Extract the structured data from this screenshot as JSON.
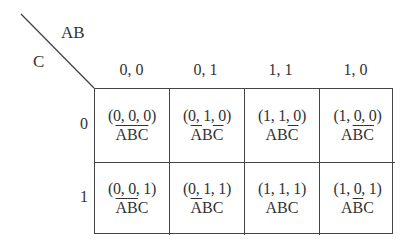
{
  "kmap": {
    "corner": {
      "col_var": "AB",
      "row_var": "C"
    },
    "col_headers": [
      "0, 0",
      "0, 1",
      "1, 1",
      "1, 0"
    ],
    "row_headers": [
      "0",
      "1"
    ],
    "rows": [
      [
        {
          "tuple": "(0, 0, 0)",
          "term": [
            {
              "v": "A",
              "neg": true
            },
            {
              "v": "B",
              "neg": true
            },
            {
              "v": "C",
              "neg": true
            }
          ]
        },
        {
          "tuple": "(0, 1, 0)",
          "term": [
            {
              "v": "A",
              "neg": true
            },
            {
              "v": "B",
              "neg": false
            },
            {
              "v": "C",
              "neg": true
            }
          ]
        },
        {
          "tuple": "(1, 1, 0)",
          "term": [
            {
              "v": "A",
              "neg": false
            },
            {
              "v": "B",
              "neg": false
            },
            {
              "v": "C",
              "neg": true
            }
          ]
        },
        {
          "tuple": "(1, 0, 0)",
          "term": [
            {
              "v": "A",
              "neg": false
            },
            {
              "v": "B",
              "neg": true
            },
            {
              "v": "C",
              "neg": true
            }
          ]
        }
      ],
      [
        {
          "tuple": "(0, 0, 1)",
          "term": [
            {
              "v": "A",
              "neg": true
            },
            {
              "v": "B",
              "neg": true
            },
            {
              "v": "C",
              "neg": false
            }
          ]
        },
        {
          "tuple": "(0, 1, 1)",
          "term": [
            {
              "v": "A",
              "neg": true
            },
            {
              "v": "B",
              "neg": false
            },
            {
              "v": "C",
              "neg": false
            }
          ]
        },
        {
          "tuple": "(1, 1, 1)",
          "term": [
            {
              "v": "A",
              "neg": false
            },
            {
              "v": "B",
              "neg": false
            },
            {
              "v": "C",
              "neg": false
            }
          ]
        },
        {
          "tuple": "(1, 0, 1)",
          "term": [
            {
              "v": "A",
              "neg": false
            },
            {
              "v": "B",
              "neg": true
            },
            {
              "v": "C",
              "neg": false
            }
          ]
        }
      ]
    ]
  }
}
